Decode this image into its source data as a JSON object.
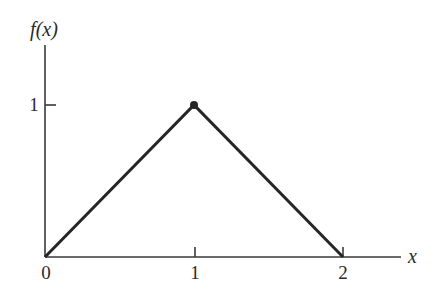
{
  "chart_data": {
    "type": "line",
    "title": "",
    "xlabel": "x",
    "ylabel": "f(x)",
    "x": [
      0,
      1,
      2
    ],
    "series": [
      {
        "name": "f(x)",
        "values": [
          0,
          1,
          0
        ]
      }
    ],
    "xticks": [
      0,
      1,
      2
    ],
    "xtick_labels": [
      "0",
      "1",
      "2"
    ],
    "yticks": [
      1
    ],
    "ytick_labels": [
      "1"
    ],
    "xlim": [
      0,
      2.4
    ],
    "ylim": [
      0,
      1.4
    ],
    "grid": false,
    "legend": null,
    "annotations": [
      {
        "type": "point-marker",
        "x": 1,
        "y": 1,
        "style": "filled-dot"
      }
    ],
    "shape": "triangular density function"
  },
  "labels": {
    "ylabel": "f(x)",
    "xlabel": "x",
    "x0": "0",
    "x1": "1",
    "x2": "2",
    "y1": "1"
  },
  "colors": {
    "line": "#262626",
    "axis": "#3a3a3a",
    "background": "#ffffff"
  }
}
